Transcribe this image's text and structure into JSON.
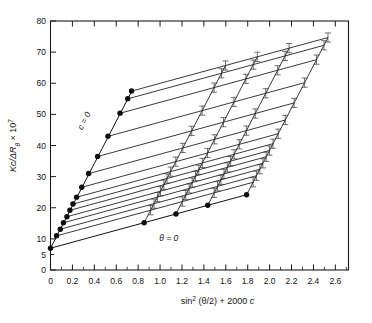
{
  "figure": {
    "kind": "zimm-plot",
    "background": "#ffffff",
    "ink": "#141414"
  },
  "axes": {
    "x": {
      "label": "sin",
      "label_sup": "2",
      "label_rest": " (θ/2) + 2000 ",
      "label_italic": "c",
      "label_full": "sin² (θ/2) + 2000 c",
      "min": 0,
      "max": 2.72,
      "major_ticks": [
        0,
        0.2,
        0.4,
        0.6,
        0.8,
        1.0,
        1.2,
        1.4,
        1.6,
        1.8,
        2.0,
        2.2,
        2.4,
        2.6
      ],
      "major_tick_labels": [
        "0",
        "0.2",
        "0.4",
        "0.6",
        "0.8",
        "1.0",
        "1.2",
        "1.4",
        "1.6",
        "1.8",
        "2.0",
        "2.2",
        "2.4",
        "2.6"
      ],
      "minor_tick_step": 0.1
    },
    "y": {
      "label_main": "Kc/ΔR",
      "label_sub": "θ",
      "label_tail": " × 10",
      "label_exp": "7",
      "label_full": "Kc/ΔRθ × 10⁷",
      "min": 0,
      "max": 80,
      "major_ticks": [
        0,
        5,
        10,
        20,
        30,
        40,
        50,
        60,
        70,
        80
      ],
      "major_tick_labels": [
        "0",
        "5",
        "10",
        "20",
        "30",
        "40",
        "50",
        "60",
        "70",
        "80"
      ]
    }
  },
  "annotations": [
    {
      "id": "c-zero",
      "text": "c = 0",
      "x": 0.33,
      "y": 47.5,
      "rotation": -62
    },
    {
      "id": "theta-zero",
      "text": "θ = 0",
      "x": 1.08,
      "y": 9.2,
      "rotation": 0
    }
  ],
  "chart_data": {
    "type": "scatter",
    "title": "",
    "subtitle": "",
    "xlabel": "sin² (θ/2) + 2000 c",
    "ylabel": "Kc/ΔRθ × 10⁷",
    "xlim": [
      0,
      2.72
    ],
    "ylim": [
      0,
      80
    ],
    "grid": false,
    "legend_position": "none",
    "common_intercept": {
      "x": 0.0,
      "y": 7.0
    },
    "angle_line_intercepts": [
      7.0,
      11.0,
      13.1,
      15.2,
      17.1,
      19.2,
      21.2,
      23.4,
      26.6,
      31.0,
      36.5,
      43.0,
      50.4,
      55.0,
      57.5
    ],
    "angle_line_slope": 9.6,
    "conc_line_slope": 68.0,
    "conc_line_x_offsets": [
      0.0,
      0.855,
      1.145,
      1.435,
      1.79
    ],
    "series": [
      {
        "name": "c = 0 extrapolation",
        "marker": "filled-circle",
        "x": [
          0.0,
          0.055,
          0.09,
          0.118,
          0.15,
          0.177,
          0.205,
          0.238,
          0.285,
          0.348,
          0.43,
          0.525,
          0.635,
          0.705,
          0.74
        ],
        "y": [
          7.0,
          11.0,
          13.1,
          15.2,
          17.1,
          19.2,
          21.2,
          23.4,
          26.6,
          31.0,
          36.5,
          43.0,
          50.4,
          55.0,
          57.5
        ]
      },
      {
        "name": "theta = 0 extrapolation",
        "marker": "filled-circle",
        "x": [
          0.0,
          0.855,
          1.145,
          1.435,
          1.79
        ],
        "y": [
          7.0,
          15.2,
          18.0,
          20.8,
          24.2
        ]
      }
    ]
  }
}
